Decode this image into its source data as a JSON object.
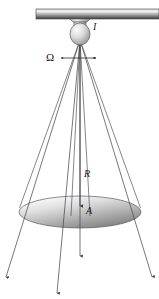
{
  "figure": {
    "labels": {
      "intensity": "I",
      "solid_angle": "Ω",
      "distance": "R",
      "area": "A"
    },
    "colors": {
      "ray": "#4a4a52",
      "outline": "#55555c",
      "ceiling_light": "#e8e8e8",
      "ceiling_dark": "#4a4a4a",
      "disk_light": "#f2f2f2",
      "disk_dark": "#8d8d8d",
      "bulb_light": "#f0f0f0",
      "bulb_dark": "#909090",
      "text": "#1a1a1a",
      "background": "#ffffff"
    },
    "geometry": {
      "source_x": 80,
      "source_y": 40,
      "ceiling_bar": {
        "x": 36,
        "y": 9,
        "width": 123,
        "height": 10
      },
      "disk": {
        "cx": 80,
        "cy": 212,
        "rx": 61,
        "ry": 16
      },
      "bulb": {
        "cx": 80,
        "cy": 34,
        "rx": 10,
        "ry": 11
      },
      "solid_angle_arrow_y": 58,
      "solid_angle_arrow_x1": 64,
      "solid_angle_arrow_x2": 96
    },
    "label_positions": {
      "intensity": {
        "x": 93,
        "y": 30
      },
      "solid_angle": {
        "x": 48,
        "y": 59
      },
      "distance": {
        "x": 84,
        "y": 174
      },
      "area": {
        "x": 86,
        "y": 211
      }
    },
    "rays": [
      {
        "name": "outer-left",
        "x2": 6,
        "y2": 277
      },
      {
        "name": "inner-left",
        "x2": 57,
        "y2": 293
      },
      {
        "name": "center",
        "x2": 80,
        "y2": 256
      },
      {
        "name": "outer-right",
        "x2": 152,
        "y2": 277
      }
    ],
    "cone_edges": [
      {
        "name": "cone-left-outer",
        "x2": 12,
        "y2": 228
      },
      {
        "name": "cone-right-outer",
        "x2": 148,
        "y2": 228
      },
      {
        "name": "cone-left-inner",
        "x2": 72,
        "y2": 215
      },
      {
        "name": "cone-right-inner",
        "x2": 90,
        "y2": 215
      }
    ]
  }
}
